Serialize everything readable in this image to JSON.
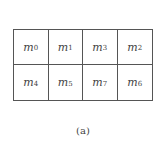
{
  "kmap": {
    "rows": [
      [
        {
          "var": "m",
          "sub": "0"
        },
        {
          "var": "m",
          "sub": "1"
        },
        {
          "var": "m",
          "sub": "3"
        },
        {
          "var": "m",
          "sub": "2"
        }
      ],
      [
        {
          "var": "m",
          "sub": "4"
        },
        {
          "var": "m",
          "sub": "5"
        },
        {
          "var": "m",
          "sub": "7"
        },
        {
          "var": "m",
          "sub": "6"
        }
      ]
    ]
  },
  "caption": "(a)"
}
